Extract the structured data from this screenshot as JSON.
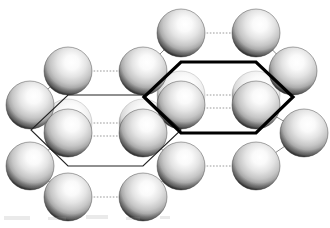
{
  "figure": {
    "width": 330,
    "height": 228,
    "background_color": "#ffffff"
  },
  "style": {
    "sphere_radius": 24,
    "sphere_highlight_color": "#ffffff",
    "sphere_mid_color": "#d8d8d8",
    "sphere_edge_color": "#6e6e6e",
    "sphere_rim_color": "#4a4a4a",
    "solid_bond_color": "#8a8a8a",
    "dotted_bond_color": "#9a9a9a",
    "hexagon_thin_color": "#222222",
    "hexagon_bold_color": "#000000",
    "hexagon_thin_width": 1.1,
    "hexagon_bold_width": 3.2,
    "highlight_offset_x": 0.18,
    "highlight_offset_y": -0.3
  },
  "spheres": [
    {
      "id": "s-top-1",
      "label": "atom-top-left",
      "cx": 181,
      "cy": 33,
      "r": 24,
      "layer": "front"
    },
    {
      "id": "s-top-2",
      "label": "atom-top-right",
      "cx": 256,
      "cy": 33,
      "r": 24,
      "layer": "front"
    },
    {
      "id": "s-r2-1",
      "label": "atom-row2-left",
      "cx": 68,
      "cy": 71,
      "r": 24,
      "layer": "front"
    },
    {
      "id": "s-r2-2",
      "label": "atom-row2-midleft",
      "cx": 143,
      "cy": 71,
      "r": 24,
      "layer": "front"
    },
    {
      "id": "s-r2-3",
      "label": "atom-row2-right",
      "cx": 293,
      "cy": 71,
      "r": 24,
      "layer": "front"
    },
    {
      "id": "s-r3-0",
      "label": "atom-row3-farleft",
      "cx": 30,
      "cy": 105,
      "r": 24,
      "layer": "front"
    },
    {
      "id": "s-ghost-1",
      "label": "atom-row3-back-left",
      "cx": 181,
      "cy": 95,
      "r": 24,
      "layer": "back"
    },
    {
      "id": "s-ghost-2",
      "label": "atom-row3-back-right",
      "cx": 256,
      "cy": 95,
      "r": 24,
      "layer": "back"
    },
    {
      "id": "s-r3-1",
      "label": "atom-row3-left",
      "cx": 181,
      "cy": 105,
      "r": 24,
      "layer": "front"
    },
    {
      "id": "s-r3-2",
      "label": "atom-row3-right",
      "cx": 256,
      "cy": 105,
      "r": 24,
      "layer": "front"
    },
    {
      "id": "s-ghost-3",
      "label": "atom-row4-back-left",
      "cx": 68,
      "cy": 123,
      "r": 24,
      "layer": "back"
    },
    {
      "id": "s-ghost-4",
      "label": "atom-row4-back-right",
      "cx": 143,
      "cy": 123,
      "r": 24,
      "layer": "back"
    },
    {
      "id": "s-r4-1",
      "label": "atom-row4-left",
      "cx": 68,
      "cy": 133,
      "r": 24,
      "layer": "front"
    },
    {
      "id": "s-r4-2",
      "label": "atom-row4-right",
      "cx": 143,
      "cy": 133,
      "r": 24,
      "layer": "front"
    },
    {
      "id": "s-r4-3",
      "label": "atom-row4-farright",
      "cx": 304,
      "cy": 133,
      "r": 24,
      "layer": "front"
    },
    {
      "id": "s-r5-0",
      "label": "atom-row5-farleft",
      "cx": 30,
      "cy": 166,
      "r": 24,
      "layer": "front"
    },
    {
      "id": "s-r5-1",
      "label": "atom-row5-left",
      "cx": 181,
      "cy": 166,
      "r": 24,
      "layer": "front"
    },
    {
      "id": "s-r5-2",
      "label": "atom-row5-right",
      "cx": 256,
      "cy": 166,
      "r": 24,
      "layer": "front"
    },
    {
      "id": "s-r6-1",
      "label": "atom-bottom-left",
      "cx": 68,
      "cy": 197,
      "r": 24,
      "layer": "front"
    },
    {
      "id": "s-r6-2",
      "label": "atom-bottom-right",
      "cx": 143,
      "cy": 197,
      "r": 24,
      "layer": "front"
    }
  ],
  "bonds_solid": [
    {
      "id": "b-s-1",
      "x1": 181,
      "y1": 33,
      "x2": 143,
      "y2": 71
    },
    {
      "id": "b-s-2",
      "x1": 256,
      "y1": 33,
      "x2": 293,
      "y2": 71
    },
    {
      "id": "b-s-3",
      "x1": 68,
      "y1": 71,
      "x2": 30,
      "y2": 105
    },
    {
      "id": "b-s-4",
      "x1": 143,
      "y1": 71,
      "x2": 181,
      "y2": 105
    },
    {
      "id": "b-s-5",
      "x1": 293,
      "y1": 71,
      "x2": 256,
      "y2": 105
    },
    {
      "id": "b-s-6",
      "x1": 30,
      "y1": 105,
      "x2": 68,
      "y2": 133
    },
    {
      "id": "b-s-7",
      "x1": 181,
      "y1": 105,
      "x2": 143,
      "y2": 133
    },
    {
      "id": "b-s-8",
      "x1": 256,
      "y1": 105,
      "x2": 304,
      "y2": 133
    },
    {
      "id": "b-s-9",
      "x1": 68,
      "y1": 133,
      "x2": 30,
      "y2": 166
    },
    {
      "id": "b-s-10",
      "x1": 143,
      "y1": 133,
      "x2": 181,
      "y2": 166
    },
    {
      "id": "b-s-11",
      "x1": 304,
      "y1": 133,
      "x2": 256,
      "y2": 166
    },
    {
      "id": "b-s-12",
      "x1": 30,
      "y1": 166,
      "x2": 68,
      "y2": 197
    },
    {
      "id": "b-s-13",
      "x1": 181,
      "y1": 166,
      "x2": 143,
      "y2": 197
    }
  ],
  "bonds_dotted": [
    {
      "id": "b-d-1",
      "x1": 181,
      "y1": 33,
      "x2": 256,
      "y2": 33
    },
    {
      "id": "b-d-2",
      "x1": 68,
      "y1": 71,
      "x2": 143,
      "y2": 71
    },
    {
      "id": "b-d-3",
      "x1": 181,
      "y1": 95,
      "x2": 256,
      "y2": 95
    },
    {
      "id": "b-d-4",
      "x1": 181,
      "y1": 108,
      "x2": 256,
      "y2": 108
    },
    {
      "id": "b-d-5",
      "x1": 68,
      "y1": 123,
      "x2": 143,
      "y2": 123
    },
    {
      "id": "b-d-6",
      "x1": 68,
      "y1": 136,
      "x2": 143,
      "y2": 136
    },
    {
      "id": "b-d-7",
      "x1": 181,
      "y1": 166,
      "x2": 256,
      "y2": 166
    },
    {
      "id": "b-d-8",
      "x1": 68,
      "y1": 197,
      "x2": 143,
      "y2": 197
    }
  ],
  "hexagons": [
    {
      "id": "hex-left",
      "label": "unit-cell-outline-left",
      "emphasis": "thin",
      "points": "68,95 143,95 181,130 143,166 68,166 31,130"
    },
    {
      "id": "hex-right",
      "label": "unit-cell-outline-right",
      "emphasis": "bold",
      "points": "181,62 256,62 293,97 256,133 181,133 144,97"
    }
  ],
  "artifacts": [
    {
      "id": "smudge-1",
      "x": 4,
      "y": 216,
      "w": 26,
      "h": 4
    },
    {
      "id": "smudge-2",
      "x": 48,
      "y": 217,
      "w": 18,
      "h": 3
    },
    {
      "id": "smudge-3",
      "x": 86,
      "y": 215,
      "w": 22,
      "h": 4
    },
    {
      "id": "smudge-4",
      "x": 126,
      "y": 217,
      "w": 14,
      "h": 3
    },
    {
      "id": "smudge-5",
      "x": 160,
      "y": 216,
      "w": 10,
      "h": 3
    }
  ]
}
